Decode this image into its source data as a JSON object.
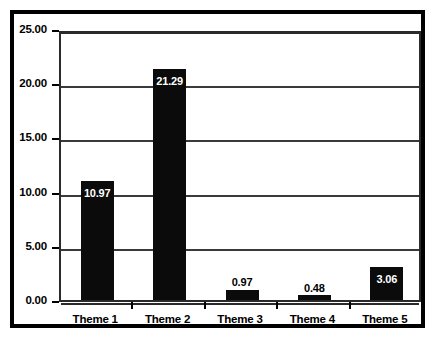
{
  "chart_data": {
    "type": "bar",
    "title": "",
    "subtitle": "",
    "xlabel": "",
    "ylabel": "",
    "categories": [
      "Theme 1",
      "Theme 2",
      "Theme 3",
      "Theme 4",
      "Theme 5"
    ],
    "values": [
      10.97,
      21.29,
      0.97,
      0.48,
      3.06
    ],
    "data_labels": [
      "10.97",
      "21.29",
      "0.97",
      "0.48",
      "3.06"
    ],
    "label_placement": [
      "inside",
      "inside",
      "outside",
      "outside",
      "inside"
    ],
    "ylim": [
      0,
      25
    ],
    "ytick_values": [
      0,
      5,
      10,
      15,
      20,
      25
    ],
    "ytick_labels": [
      "0.00",
      "5.00",
      "10.00",
      "15.00",
      "20.00",
      "25.00"
    ],
    "grid": true,
    "grid_axis": "y",
    "legend": "none",
    "bar_color": "#0b0b0b",
    "plot_background": "#ffffff",
    "axis_color": "#000000",
    "grid_color": "#3a3a3a",
    "frame_color": "#000000"
  }
}
